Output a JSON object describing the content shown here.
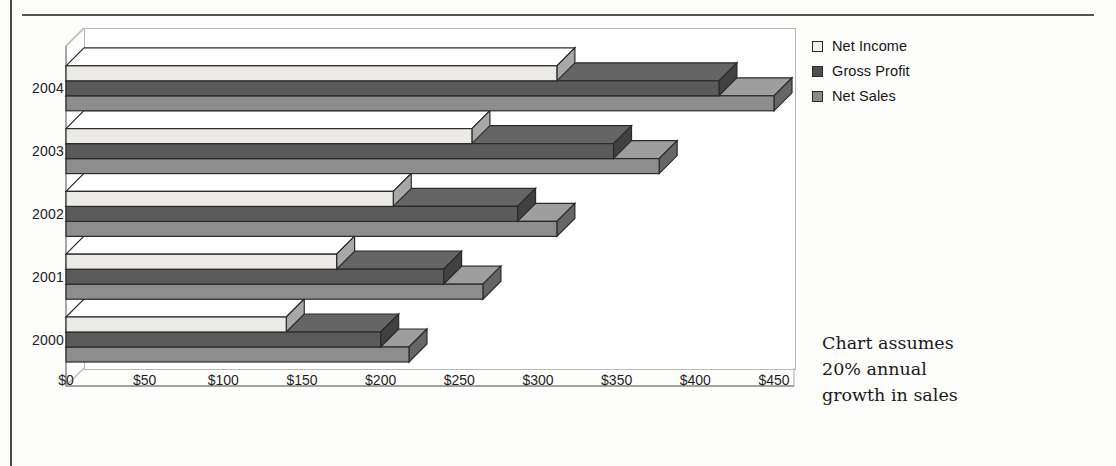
{
  "chart_data": {
    "type": "bar",
    "orientation": "horizontal",
    "style": "3d-clustered-bar",
    "title": "",
    "xlabel": "",
    "ylabel": "",
    "categories": [
      "2000",
      "2001",
      "2002",
      "2003",
      "2004"
    ],
    "series": [
      {
        "name": "Net Income",
        "color": "#eceae6",
        "values": [
          140,
          172,
          208,
          258,
          312
        ]
      },
      {
        "name": "Gross Profit",
        "color": "#5a5a5a",
        "values": [
          200,
          240,
          287,
          348,
          415
        ]
      },
      {
        "name": "Net Sales",
        "color": "#8d8d8d",
        "values": [
          218,
          265,
          312,
          377,
          450
        ]
      }
    ],
    "xlim": [
      0,
      450
    ],
    "xtick_values": [
      0,
      50,
      100,
      150,
      200,
      250,
      300,
      350,
      400,
      450
    ],
    "xtick_labels": [
      "$0",
      "$50",
      "$100",
      "$150",
      "$200",
      "$250",
      "$300",
      "$350",
      "$400",
      "$450"
    ],
    "unit_prefix": "$",
    "grid": false,
    "legend_position": "right-top",
    "annotations": [
      "Chart assumes",
      "20% annual",
      "growth in sales"
    ]
  },
  "legend": {
    "items": [
      {
        "label": "Net Income",
        "swatch": "#f2f0ec"
      },
      {
        "label": "Gross Profit",
        "swatch": "#4f4f4f"
      },
      {
        "label": "Net Sales",
        "swatch": "#8a8a8a"
      }
    ]
  },
  "note": {
    "line1": "Chart assumes",
    "line2": "20% annual",
    "line3": "growth in sales"
  }
}
